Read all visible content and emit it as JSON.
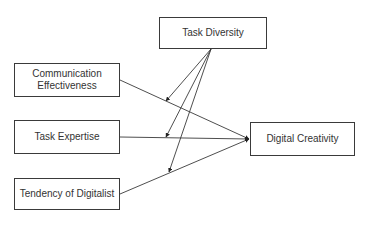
{
  "diagram": {
    "type": "research-model",
    "nodes": {
      "task_diversity": {
        "label": "Task Diversity",
        "role": "moderator"
      },
      "communication_effectiveness": {
        "label_line1": "Communication",
        "label_line2": "Effectiveness",
        "role": "independent"
      },
      "task_expertise": {
        "label": "Task Expertise",
        "role": "independent"
      },
      "tendency_of_digitalist": {
        "label": "Tendency of Digitalist",
        "role": "independent"
      },
      "digital_creativity": {
        "label": "Digital Creativity",
        "role": "dependent"
      }
    },
    "edges": [
      {
        "from": "Communication Effectiveness",
        "to": "Digital Creativity",
        "kind": "direct"
      },
      {
        "from": "Task Expertise",
        "to": "Digital Creativity",
        "kind": "direct"
      },
      {
        "from": "Tendency of Digitalist",
        "to": "Digital Creativity",
        "kind": "direct"
      },
      {
        "from": "Task Diversity",
        "to": "Communication Effectiveness -> Digital Creativity",
        "kind": "moderation"
      },
      {
        "from": "Task Diversity",
        "to": "Task Expertise -> Digital Creativity",
        "kind": "moderation"
      },
      {
        "from": "Task Diversity",
        "to": "Tendency of Digitalist -> Digital Creativity",
        "kind": "moderation"
      }
    ],
    "colors": {
      "line": "#3a3a3a",
      "text": "#333333",
      "background": "#ffffff"
    }
  }
}
